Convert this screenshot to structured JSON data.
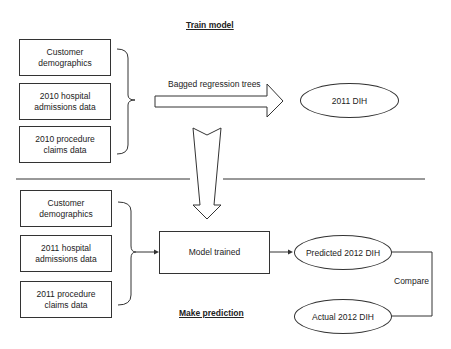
{
  "train_section": {
    "title": "Train model",
    "inputs": [
      {
        "label": "Customer demographics"
      },
      {
        "label": "2010 hospital admissions data"
      },
      {
        "label": "2010 procedure claims data"
      }
    ],
    "method_label": "Bagged regression trees",
    "output": {
      "label": "2011 DIH"
    }
  },
  "predict_section": {
    "title": "Make prediction",
    "inputs": [
      {
        "label": "Customer demographics"
      },
      {
        "label": "2011 hospital admissions data"
      },
      {
        "label": "2011 procedure claims data"
      }
    ],
    "model": {
      "label": "Model trained"
    },
    "predicted": {
      "label": "Predicted 2012 DIH"
    },
    "actual": {
      "label": "Actual 2012 DIH"
    },
    "compare_label": "Compare"
  },
  "colors": {
    "stroke": "#333333",
    "background": "#ffffff"
  }
}
